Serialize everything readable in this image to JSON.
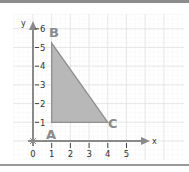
{
  "figure": {
    "x_axis_label": "x",
    "y_axis_label": "y",
    "x_ticks": [
      "0",
      "1",
      "2",
      "3",
      "4",
      "5"
    ],
    "y_ticks": [
      "1",
      "2",
      "3",
      "4",
      "5",
      "6"
    ],
    "vertices": [
      {
        "label": "A",
        "x": 1,
        "y": 1
      },
      {
        "label": "B",
        "x": 1,
        "y": 5.5
      },
      {
        "label": "C",
        "x": 4,
        "y": 1
      }
    ],
    "colors": {
      "fill": "#b8b8b8",
      "stroke": "#8f8f8f",
      "axis": "#8a8a8a",
      "grid": "#e6e6e6",
      "vertex_label": "#8a8a8a"
    }
  }
}
